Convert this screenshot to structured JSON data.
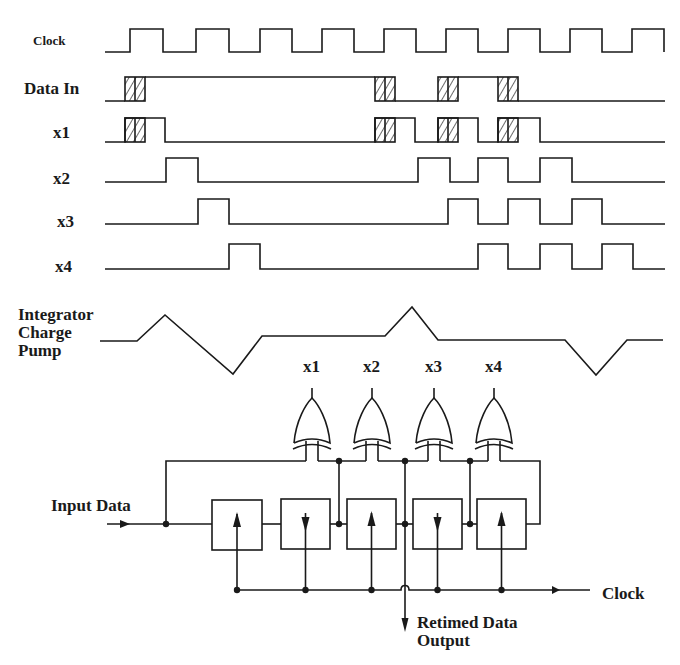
{
  "colors": {
    "ink": "#1a1a1a",
    "background": "#ffffff"
  },
  "timing": {
    "x_start": 105,
    "x_end": 665,
    "signals": [
      {
        "name": "Clock",
        "label_x": 33,
        "label_y": 33,
        "size": "small",
        "y_low": 52,
        "y_high": 29,
        "edges": [
          130,
          163,
          196,
          229,
          260,
          292,
          322,
          354,
          384,
          416,
          446,
          478,
          508,
          540,
          570,
          602,
          632,
          664
        ]
      },
      {
        "name": "Data In",
        "label_x": 24,
        "label_y": 80,
        "size": "med",
        "y_low": 101,
        "y_high": 77,
        "edges": [
          125,
          145,
          375,
          395,
          438,
          458,
          498,
          518
        ],
        "hatched": [
          [
            125,
            145
          ],
          [
            375,
            395
          ],
          [
            438,
            458
          ],
          [
            498,
            518
          ]
        ],
        "pattern": "low-high-low-high-low"
      },
      {
        "name": "x1",
        "label_x": 53,
        "label_y": 124,
        "size": "med",
        "y_low": 142,
        "y_high": 118,
        "pulses": [
          [
            125,
            165
          ],
          [
            375,
            415
          ],
          [
            438,
            478
          ],
          [
            498,
            540
          ]
        ],
        "hatched": [
          [
            125,
            145
          ],
          [
            375,
            395
          ],
          [
            438,
            458
          ],
          [
            498,
            518
          ]
        ]
      },
      {
        "name": "x2",
        "label_x": 53,
        "label_y": 170,
        "size": "med",
        "y_low": 182,
        "y_high": 158,
        "pulses": [
          [
            166,
            198
          ],
          [
            418,
            450
          ],
          [
            478,
            508
          ],
          [
            540,
            572
          ]
        ]
      },
      {
        "name": "x3",
        "label_x": 57,
        "label_y": 212,
        "size": "med",
        "y_low": 224,
        "y_high": 199,
        "pulses": [
          [
            198,
            229
          ],
          [
            448,
            478
          ],
          [
            508,
            540
          ],
          [
            572,
            602
          ]
        ]
      },
      {
        "name": "x4",
        "label_x": 55,
        "label_y": 258,
        "size": "med",
        "y_low": 269,
        "y_high": 244,
        "pulses": [
          [
            229,
            260
          ],
          [
            478,
            508
          ],
          [
            540,
            572
          ],
          [
            602,
            633
          ]
        ]
      }
    ]
  },
  "integrator": {
    "label": "Integrator\nCharge\nPump",
    "label_x": 18,
    "label_y": 308,
    "points": [
      [
        100,
        341
      ],
      [
        137,
        341
      ],
      [
        165,
        315
      ],
      [
        233,
        374
      ],
      [
        262,
        336
      ],
      [
        385,
        336
      ],
      [
        412,
        307
      ],
      [
        438,
        340
      ],
      [
        565,
        340
      ],
      [
        596,
        375
      ],
      [
        627,
        340
      ],
      [
        663,
        340
      ]
    ]
  },
  "circuit": {
    "gates": [
      {
        "label": "x1",
        "cx": 312,
        "top": 390
      },
      {
        "label": "x2",
        "cx": 372,
        "top": 390
      },
      {
        "label": "x3",
        "cx": 434,
        "top": 390
      },
      {
        "label": "x4",
        "cx": 494,
        "top": 390
      }
    ],
    "registers": [
      {
        "x": 212,
        "y": 500,
        "w": 50,
        "h": 50,
        "arrow": "up"
      },
      {
        "x": 281,
        "y": 499,
        "w": 49,
        "h": 50,
        "arrow": "down"
      },
      {
        "x": 347,
        "y": 499,
        "w": 49,
        "h": 50,
        "arrow": "up"
      },
      {
        "x": 413,
        "y": 499,
        "w": 49,
        "h": 50,
        "arrow": "down"
      },
      {
        "x": 477,
        "y": 499,
        "w": 49,
        "h": 50,
        "arrow": "up"
      }
    ],
    "labels": {
      "input_data": "Input Data",
      "clock": "Clock",
      "retimed": "Retimed Data\nOutput"
    }
  }
}
